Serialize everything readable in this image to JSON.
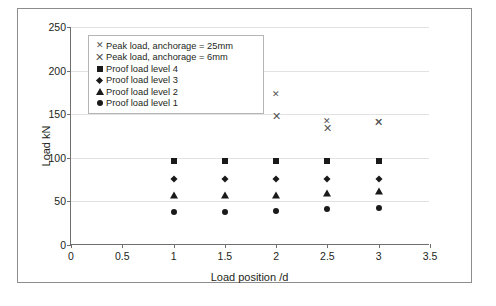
{
  "chart_data": {
    "type": "scatter",
    "title": "",
    "xlabel": "Load position /d",
    "ylabel": "Load kN",
    "xlim": [
      0,
      3.5
    ],
    "ylim": [
      0,
      250
    ],
    "xticks": [
      "0",
      "0.5",
      "1",
      "1.5",
      "2",
      "2.5",
      "3",
      "3.5"
    ],
    "xtick_values": [
      0,
      0.5,
      1,
      1.5,
      2,
      2.5,
      3,
      3.5
    ],
    "yticks": [
      "0",
      "50",
      "100",
      "150",
      "200",
      "250"
    ],
    "ytick_values": [
      0,
      50,
      100,
      150,
      200,
      250
    ],
    "grid": "horizontal",
    "legend_position": "top-left-inside",
    "series": [
      {
        "name": "Peak load, anchorage = 25mm",
        "marker": "cross-small",
        "x": [
          1.5,
          2,
          2.5,
          3
        ],
        "y": [
          199,
          173,
          142,
          141
        ]
      },
      {
        "name": "Peak load, anchorage = 6mm",
        "marker": "cross-large",
        "x": [
          1.5,
          2,
          2.5,
          3
        ],
        "y": [
          158,
          148,
          134,
          141
        ]
      },
      {
        "name": "Proof load level 4",
        "marker": "square",
        "x": [
          1,
          1.5,
          2,
          2.5,
          3
        ],
        "y": [
          96,
          96,
          96,
          96,
          96
        ]
      },
      {
        "name": "Proof load level 3",
        "marker": "diamond",
        "x": [
          1,
          1.5,
          2,
          2.5,
          3
        ],
        "y": [
          76,
          76,
          76,
          76,
          76
        ]
      },
      {
        "name": "Proof load level 2",
        "marker": "triangle",
        "x": [
          1,
          1.5,
          2,
          2.5,
          3
        ],
        "y": [
          57,
          57,
          57,
          60,
          62
        ]
      },
      {
        "name": "Proof load level 1",
        "marker": "circle",
        "x": [
          1,
          1.5,
          2,
          2.5,
          3
        ],
        "y": [
          38,
          38,
          39,
          41,
          43
        ]
      }
    ]
  },
  "legend": {
    "items": [
      {
        "label": "Peak load, anchorage = 25mm",
        "marker": "cross-small"
      },
      {
        "label": "Peak load, anchorage = 6mm",
        "marker": "cross-large"
      },
      {
        "label": "Proof load level 4",
        "marker": "square"
      },
      {
        "label": "Proof load level 3",
        "marker": "diamond"
      },
      {
        "label": "Proof load level 2",
        "marker": "triangle"
      },
      {
        "label": "Proof load level 1",
        "marker": "circle"
      }
    ]
  },
  "axes": {
    "y_title": "Load kN",
    "x_title": "Load position /d"
  },
  "colors": {
    "marker": "#1a1a1a",
    "cross": "#555555",
    "axis": "#6f6f6f",
    "grid": "#e2e2e2",
    "frame": "#8d8d8d"
  }
}
